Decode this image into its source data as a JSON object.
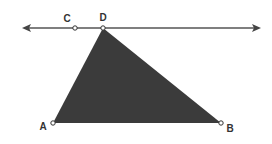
{
  "diagram": {
    "type": "geometry",
    "colors": {
      "line": "#555555",
      "triangle_fill": "#3b3b3b",
      "point_fill": "#ffffff",
      "label": "#333333"
    },
    "line": {
      "x1": 22,
      "y1": 28,
      "x2": 261,
      "y2": 28,
      "arrows": "both"
    },
    "points": [
      {
        "id": "C",
        "label": "C",
        "x": 75,
        "y": 28,
        "lx": 67,
        "ly": 22
      },
      {
        "id": "D",
        "label": "D",
        "x": 103,
        "y": 28,
        "lx": 103,
        "ly": 21
      },
      {
        "id": "A",
        "label": "A",
        "x": 53,
        "y": 123,
        "lx": 43,
        "ly": 130
      },
      {
        "id": "B",
        "label": "B",
        "x": 221,
        "y": 123,
        "lx": 230,
        "ly": 132
      }
    ],
    "triangle": [
      "A",
      "D",
      "B"
    ]
  }
}
